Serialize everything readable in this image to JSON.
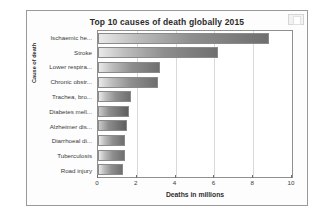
{
  "figure": {
    "corner_widget": "window-control-icon"
  },
  "chart_data": {
    "type": "bar",
    "orientation": "horizontal",
    "title": "Top 10 causes of death globally 2015",
    "xlabel": "Deaths in millions",
    "ylabel": "Cause of death",
    "categories": [
      "Ischaemic he...",
      "Stroke",
      "Lower respira...",
      "Chronic obstr...",
      "Trachea, bro...",
      "Diabetes mell...",
      "Alzheimer dis...",
      "Diarrhoeal di...",
      "Tuberculosis",
      "Road injury"
    ],
    "values": [
      8.8,
      6.2,
      3.2,
      3.1,
      1.7,
      1.6,
      1.5,
      1.4,
      1.4,
      1.3
    ],
    "xlim": [
      0,
      10
    ],
    "xticks": [
      0,
      2,
      4,
      6,
      8,
      10
    ],
    "grid": true,
    "grid_axis": "x",
    "legend": false,
    "bar_style": "gradient-gray"
  }
}
